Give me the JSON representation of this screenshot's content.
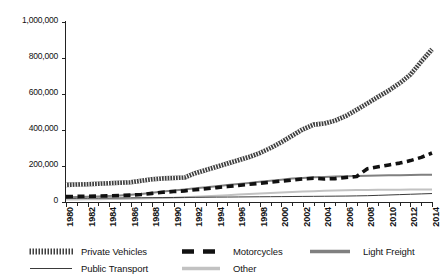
{
  "chart_data": {
    "type": "line",
    "title": "",
    "subtitle": "",
    "xlabel": "",
    "ylabel": "",
    "grid": false,
    "legend_position": "bottom",
    "ylim": [
      0,
      1000000
    ],
    "ytick_values": [
      0,
      200000,
      400000,
      600000,
      800000,
      1000000
    ],
    "ytick_labels": [
      "0",
      "200,000",
      "400,000",
      "600,000",
      "800,000",
      "1,000,000"
    ],
    "xlim": [
      1980,
      2014
    ],
    "x": [
      1980,
      1981,
      1982,
      1983,
      1984,
      1985,
      1986,
      1987,
      1988,
      1989,
      1990,
      1991,
      1992,
      1993,
      1994,
      1995,
      1996,
      1997,
      1998,
      1999,
      2000,
      2001,
      2002,
      2003,
      2004,
      2005,
      2006,
      2007,
      2008,
      2009,
      2010,
      2011,
      2012,
      2013,
      2014
    ],
    "xtick_labels": [
      "1980",
      "1982",
      "1984",
      "1986",
      "1988",
      "1990",
      "1992",
      "1994",
      "1996",
      "1998",
      "2000",
      "2002",
      "2004",
      "2006",
      "2008",
      "2010",
      "2012",
      "2014"
    ],
    "xtick_step": 2,
    "series": [
      {
        "name": "Private Vehicles",
        "style": "hatched-thick",
        "color": "#4d4d4d",
        "values": [
          95000,
          97000,
          99000,
          101000,
          104000,
          107000,
          110000,
          118000,
          126000,
          131000,
          133000,
          136000,
          160000,
          178000,
          196000,
          214000,
          232000,
          250000,
          272000,
          300000,
          332000,
          368000,
          404000,
          430000,
          436000,
          452000,
          478000,
          512000,
          548000,
          585000,
          620000,
          660000,
          708000,
          780000,
          848000
        ]
      },
      {
        "name": "Motorcycles",
        "style": "dashed-bold",
        "color": "#111111",
        "values": [
          30000,
          31000,
          32000,
          33000,
          34000,
          36000,
          38000,
          42000,
          48000,
          54000,
          58000,
          62000,
          68000,
          74000,
          80000,
          86000,
          92000,
          98000,
          104000,
          110000,
          116000,
          122000,
          128000,
          132000,
          128000,
          130000,
          136000,
          142000,
          185000,
          196000,
          206000,
          216000,
          230000,
          248000,
          272000
        ]
      },
      {
        "name": "Light Freight",
        "style": "solid-medium-gray",
        "color": "#808080",
        "values": [
          27000,
          28000,
          29000,
          31000,
          33000,
          36000,
          40000,
          45000,
          52000,
          58000,
          64000,
          70000,
          76000,
          82000,
          88000,
          94000,
          100000,
          106000,
          112000,
          118000,
          124000,
          130000,
          134000,
          137000,
          139000,
          141000,
          143000,
          145000,
          146000,
          147000,
          148000,
          149000,
          150000,
          151000,
          152000
        ]
      },
      {
        "name": "Public Transport",
        "style": "solid-thin-dark",
        "color": "#3a3a3a",
        "values": [
          20000,
          20500,
          21000,
          21500,
          22000,
          22500,
          23000,
          23500,
          24000,
          24500,
          25000,
          25500,
          26000,
          26500,
          27000,
          27500,
          28000,
          28500,
          29000,
          29500,
          30000,
          30500,
          31000,
          31500,
          32000,
          32500,
          33000,
          34000,
          35000,
          37000,
          39000,
          41000,
          43000,
          45000,
          47000
        ]
      },
      {
        "name": "Other",
        "style": "solid-light-gray",
        "color": "#c2c2c2",
        "values": [
          14000,
          14500,
          15000,
          15500,
          16000,
          17000,
          18000,
          19000,
          20500,
          22000,
          24000,
          26000,
          29000,
          32000,
          35000,
          38000,
          41000,
          44000,
          47000,
          50000,
          53000,
          56000,
          58000,
          60000,
          62000,
          64000,
          65000,
          66000,
          67000,
          67500,
          68000,
          68500,
          69000,
          69500,
          70000
        ]
      }
    ]
  },
  "legend": {
    "items": [
      {
        "label": "Private Vehicles",
        "swatch": "hatched-thick-swatch"
      },
      {
        "label": "Motorcycles",
        "swatch": "dashed-bold-swatch"
      },
      {
        "label": "Light Freight",
        "swatch": "solid-medium-gray-swatch"
      },
      {
        "label": "Public Transport",
        "swatch": "solid-thin-dark-swatch"
      },
      {
        "label": "Other",
        "swatch": "solid-light-gray-swatch"
      }
    ]
  }
}
